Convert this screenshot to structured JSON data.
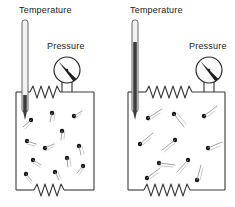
{
  "figure": {
    "type": "physics-diagram",
    "background_color": "#ffffff",
    "ink_color": "#2b2b2b"
  },
  "panels": [
    {
      "id": "left",
      "temperature_label": "Temperature",
      "pressure_label": "Pressure",
      "thermometer": {
        "mercury_level_fraction": 0.18,
        "tube_top_y": 20,
        "tube_bottom_y": 112
      },
      "gauge": {
        "needle_angle_deg": 135,
        "center_x": 67,
        "center_y": 70,
        "radius": 13
      },
      "container": {
        "x": 16,
        "y": 92,
        "width": 78,
        "height": 98,
        "top_coil_peaks": 6,
        "bottom_coil_peaks": 6
      },
      "particles": [
        {
          "x": 31,
          "y": 120,
          "tx": -8,
          "ty": 7
        },
        {
          "x": 52,
          "y": 113,
          "tx": -2,
          "ty": 9
        },
        {
          "x": 74,
          "y": 116,
          "tx": 8,
          "ty": -5
        },
        {
          "x": 62,
          "y": 131,
          "tx": -1,
          "ty": 9
        },
        {
          "x": 27,
          "y": 141,
          "tx": 9,
          "ty": 3
        },
        {
          "x": 45,
          "y": 148,
          "tx": 9,
          "ty": -4
        },
        {
          "x": 79,
          "y": 146,
          "tx": 2,
          "ty": 9
        },
        {
          "x": 33,
          "y": 160,
          "tx": 8,
          "ty": 5
        },
        {
          "x": 67,
          "y": 158,
          "tx": 1,
          "ty": 9
        },
        {
          "x": 26,
          "y": 174,
          "tx": 6,
          "ty": 7
        },
        {
          "x": 55,
          "y": 172,
          "tx": 4,
          "ty": 8
        },
        {
          "x": 83,
          "y": 166,
          "tx": -6,
          "ty": 7
        }
      ]
    },
    {
      "id": "right",
      "temperature_label": "Temperature",
      "pressure_label": "Pressure",
      "thermometer": {
        "mercury_level_fraction": 0.76,
        "tube_top_y": 20,
        "tube_bottom_y": 112
      },
      "gauge": {
        "needle_angle_deg": 135,
        "center_x": 91,
        "center_y": 70,
        "radius": 13
      },
      "container": {
        "x": 10,
        "y": 92,
        "width": 97,
        "height": 98,
        "top_coil_peaks": 9,
        "bottom_coil_peaks": 9
      },
      "particles": [
        {
          "x": 30,
          "y": 118,
          "tx": 14,
          "ty": -9
        },
        {
          "x": 56,
          "y": 114,
          "tx": 10,
          "ty": 13
        },
        {
          "x": 86,
          "y": 116,
          "tx": 13,
          "ty": -10
        },
        {
          "x": 22,
          "y": 144,
          "tx": 13,
          "ty": -11
        },
        {
          "x": 57,
          "y": 140,
          "tx": -13,
          "ty": 10
        },
        {
          "x": 90,
          "y": 148,
          "tx": 14,
          "ty": -6
        },
        {
          "x": 41,
          "y": 163,
          "tx": 16,
          "ty": 2
        },
        {
          "x": 70,
          "y": 160,
          "tx": -11,
          "ty": 12
        },
        {
          "x": 29,
          "y": 178,
          "tx": 13,
          "ty": -10
        },
        {
          "x": 79,
          "y": 180,
          "tx": 4,
          "ty": -15
        }
      ]
    }
  ]
}
